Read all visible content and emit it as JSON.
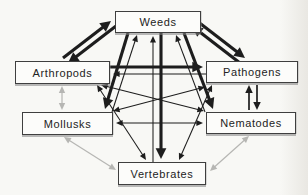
{
  "diagram": {
    "colors": {
      "line_black": "#1d1d1d",
      "line_gray": "#b6b6b3",
      "box_border": "#3f3f3f",
      "box_fill": "#fcfcfa",
      "background": "#f8f8f5"
    },
    "nodes": {
      "weeds": {
        "label": "Weeds"
      },
      "arthropods": {
        "label": "Arthropods"
      },
      "pathogens": {
        "label": "Pathogens"
      },
      "mollusks": {
        "label": "Mollusks"
      },
      "nematodes": {
        "label": "Nematodes"
      },
      "vertebrates": {
        "label": "Vertebrates"
      }
    },
    "edges": [
      {
        "from": "arthropods",
        "to": "weeds",
        "x1": 63,
        "y1": 58,
        "x2": 111,
        "y2": 21,
        "weight": "heavy",
        "color": "black",
        "arrow_start": false,
        "arrow_end": true
      },
      {
        "from": "weeds",
        "to": "arthropods",
        "x1": 116,
        "y1": 26,
        "x2": 68,
        "y2": 63,
        "weight": "heavy",
        "color": "black",
        "arrow_start": false,
        "arrow_end": true
      },
      {
        "from": "weeds",
        "to": "pathogens",
        "x1": 197,
        "y1": 21,
        "x2": 245,
        "y2": 58,
        "weight": "heavy",
        "color": "black",
        "arrow_start": false,
        "arrow_end": true
      },
      {
        "from": "pathogens",
        "to": "weeds",
        "x1": 240,
        "y1": 63,
        "x2": 192,
        "y2": 26,
        "weight": "heavy",
        "color": "black",
        "arrow_start": false,
        "arrow_end": true
      },
      {
        "from": "arthropods",
        "to": "pathogens",
        "x1": 110,
        "y1": 67,
        "x2": 203,
        "y2": 67,
        "weight": "heavy",
        "color": "black",
        "arrow_start": false,
        "arrow_end": true
      },
      {
        "from": "pathogens",
        "to": "arthropods",
        "x1": 206,
        "y1": 74,
        "x2": 113,
        "y2": 74,
        "weight": "light",
        "color": "black",
        "arrow_start": false,
        "arrow_end": true
      },
      {
        "from": "weeds",
        "to": "mollusks",
        "x1": 128,
        "y1": 33,
        "x2": 105,
        "y2": 109,
        "weight": "heavy",
        "color": "black",
        "arrow_start": false,
        "arrow_end": true
      },
      {
        "from": "mollusks",
        "to": "weeds",
        "x1": 112,
        "y1": 112,
        "x2": 137,
        "y2": 35,
        "weight": "light",
        "color": "black",
        "arrow_start": false,
        "arrow_end": true
      },
      {
        "from": "weeds",
        "to": "nematodes",
        "x1": 184,
        "y1": 33,
        "x2": 213,
        "y2": 109,
        "weight": "heavy",
        "color": "black",
        "arrow_start": false,
        "arrow_end": true
      },
      {
        "from": "nematodes",
        "to": "weeds",
        "x1": 205,
        "y1": 112,
        "x2": 176,
        "y2": 35,
        "weight": "light",
        "color": "black",
        "arrow_start": false,
        "arrow_end": true
      },
      {
        "from": "weeds",
        "to": "vertebrates",
        "x1": 161,
        "y1": 33,
        "x2": 161,
        "y2": 159,
        "weight": "heavy",
        "color": "black",
        "arrow_start": false,
        "arrow_end": true
      },
      {
        "from": "vertebrates",
        "to": "weeds",
        "x1": 153,
        "y1": 162,
        "x2": 153,
        "y2": 36,
        "weight": "light",
        "color": "black",
        "arrow_start": false,
        "arrow_end": true
      },
      {
        "from": "nematodes",
        "to": "pathogens",
        "x1": 249,
        "y1": 110,
        "x2": 249,
        "y2": 85,
        "weight": "medium",
        "color": "black",
        "arrow_start": false,
        "arrow_end": true
      },
      {
        "from": "pathogens",
        "to": "nematodes",
        "x1": 257,
        "y1": 85,
        "x2": 257,
        "y2": 110,
        "weight": "medium",
        "color": "black",
        "arrow_start": false,
        "arrow_end": true
      },
      {
        "from": "arthropods",
        "to": "mollusks",
        "x1": 62,
        "y1": 86,
        "x2": 62,
        "y2": 110,
        "weight": "light",
        "color": "gray",
        "arrow_start": true,
        "arrow_end": true
      },
      {
        "from": "mollusks",
        "to": "nematodes",
        "x1": 116,
        "y1": 123,
        "x2": 203,
        "y2": 123,
        "weight": "light",
        "color": "black",
        "arrow_start": true,
        "arrow_end": true
      },
      {
        "from": "mollusks",
        "to": "pathogens",
        "x1": 113,
        "y1": 111,
        "x2": 205,
        "y2": 87,
        "weight": "light",
        "color": "black",
        "arrow_start": true,
        "arrow_end": true
      },
      {
        "from": "arthropods",
        "to": "nematodes",
        "x1": 101,
        "y1": 85,
        "x2": 204,
        "y2": 111,
        "weight": "light",
        "color": "black",
        "arrow_start": true,
        "arrow_end": true
      },
      {
        "from": "arthropods",
        "to": "vertebrates",
        "x1": 97,
        "y1": 85,
        "x2": 146,
        "y2": 160,
        "weight": "light",
        "color": "black",
        "arrow_start": true,
        "arrow_end": true
      },
      {
        "from": "pathogens",
        "to": "vertebrates",
        "x1": 212,
        "y1": 85,
        "x2": 179,
        "y2": 160,
        "weight": "light",
        "color": "black",
        "arrow_start": true,
        "arrow_end": true
      },
      {
        "from": "mollusks",
        "to": "vertebrates",
        "x1": 64,
        "y1": 137,
        "x2": 116,
        "y2": 170,
        "weight": "light",
        "color": "gray",
        "arrow_start": true,
        "arrow_end": true
      },
      {
        "from": "nematodes",
        "to": "vertebrates",
        "x1": 249,
        "y1": 136,
        "x2": 210,
        "y2": 171,
        "weight": "light",
        "color": "gray",
        "arrow_start": true,
        "arrow_end": true
      }
    ]
  }
}
